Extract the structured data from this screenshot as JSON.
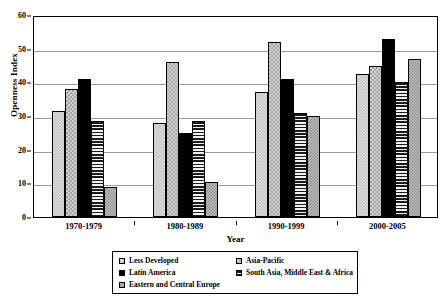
{
  "chart_data": {
    "type": "bar",
    "title": "",
    "xlabel": "Year",
    "ylabel": "Openness Index",
    "ylim": [
      0,
      60
    ],
    "yticks": [
      0,
      10,
      20,
      30,
      40,
      50,
      60
    ],
    "grid": true,
    "legend_position": "bottom",
    "categories": [
      "1970-1979",
      "1980-1989",
      "1990-1999",
      "2000-2005"
    ],
    "series": [
      {
        "name": "Less Developed",
        "pattern": "light-checker",
        "values": [
          31.5,
          28,
          37,
          42.5
        ]
      },
      {
        "name": "Asia-Pacific",
        "pattern": "gray-checker",
        "values": [
          38,
          46,
          52,
          45
        ]
      },
      {
        "name": "Latin America",
        "pattern": "solid-black",
        "values": [
          41,
          25,
          41,
          53
        ]
      },
      {
        "name": "South Asia, Middle East & Africa",
        "pattern": "horizontal-stripe",
        "values": [
          28.5,
          28.5,
          31,
          40
        ]
      },
      {
        "name": "Eastern and Central Europe",
        "pattern": "cross-hatch",
        "values": [
          9,
          10.5,
          30,
          47
        ]
      }
    ]
  },
  "legend": {
    "entries": [
      {
        "label": "Less Developed"
      },
      {
        "label": "Asia-Pacific"
      },
      {
        "label": "Latin America"
      },
      {
        "label": "South Asia, Middle East & Africa"
      },
      {
        "label": "Eastern and Central Europe"
      }
    ]
  },
  "colors": {
    "axis": "#000000",
    "gridline": "#9a9a9a",
    "background": "#ffffff",
    "latin_america_fill": "#000000"
  }
}
